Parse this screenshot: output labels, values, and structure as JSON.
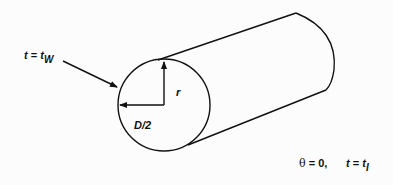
{
  "diagram": {
    "type": "cylinder-cross-section",
    "labels": {
      "wall_condition": {
        "var": "t",
        "eq": " = ",
        "val": "t",
        "sub": "W"
      },
      "radius": "r",
      "half_diameter": "D/2",
      "initial_theta": {
        "sym": "θ",
        "rest": " = 0,"
      },
      "initial_temp": {
        "var": "t",
        "eq": " = ",
        "val": "t",
        "sub": "I"
      }
    },
    "colors": {
      "stroke": "#111111",
      "background": "#fcfcfc"
    }
  }
}
